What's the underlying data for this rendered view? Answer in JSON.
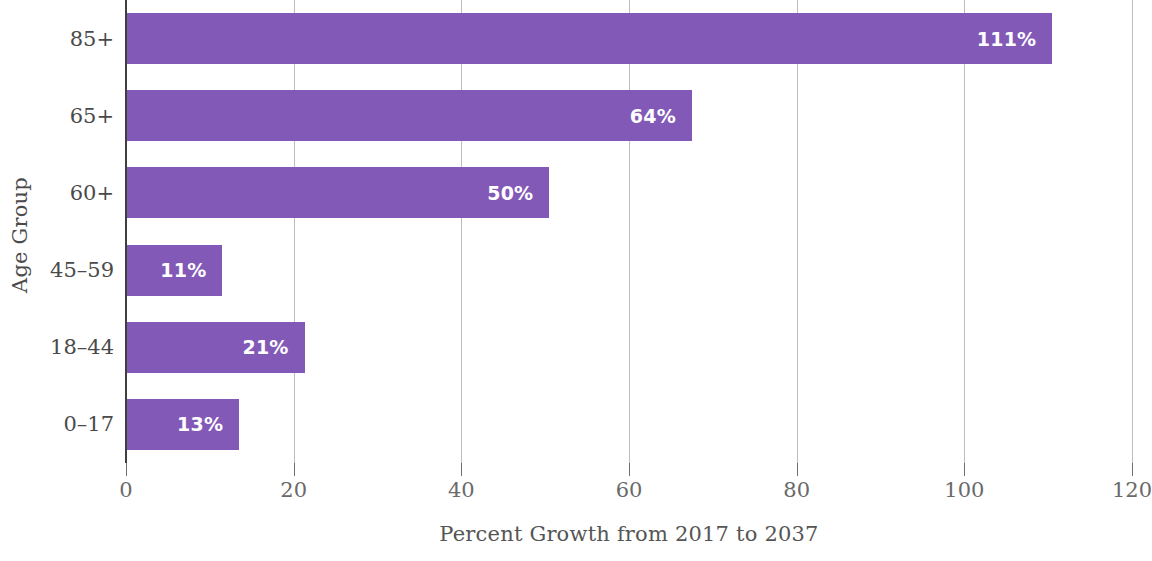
{
  "chart_data": {
    "type": "bar",
    "orientation": "horizontal",
    "title": "",
    "xlabel": "Percent Growth from 2017 to 2037",
    "ylabel": "Age Group",
    "categories": [
      "85+",
      "65+",
      "60+",
      "45–59",
      "18–44",
      "0–17"
    ],
    "values": [
      111,
      64,
      50,
      11,
      21,
      13
    ],
    "value_labels": [
      "111%",
      "64%",
      "50%",
      "11%",
      "21%",
      "13%"
    ],
    "bar_plot_values": [
      110.5,
      67.5,
      50.5,
      11.5,
      21.3,
      13.5
    ],
    "xlim": [
      0,
      120
    ],
    "xticks": [
      0,
      20,
      40,
      60,
      80,
      100,
      120
    ],
    "xtick_labels": [
      "0",
      "20",
      "40",
      "60",
      "80",
      "100",
      "120"
    ],
    "grid": "vertical",
    "legend": "none",
    "bar_color": "#8359b8",
    "value_label_color": "#ffffff",
    "axis_color": "#3f3f3f",
    "gridline_color": "#9a9a9a",
    "text_color": "#4a4a4a",
    "background": "#ffffff"
  }
}
